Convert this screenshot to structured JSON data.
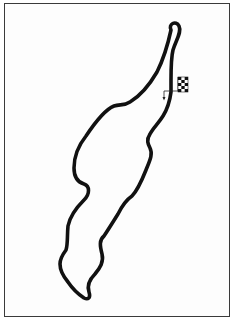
{
  "diagram": {
    "type": "race-track-map",
    "track_color": "#111111",
    "frame_color": "#3a3a3a",
    "background_color": "#ffffff",
    "start_finish": {
      "icon": "checkered-flag-icon",
      "direction_arrow": "arrow-down-icon"
    }
  }
}
